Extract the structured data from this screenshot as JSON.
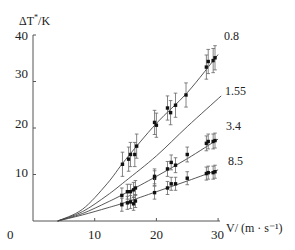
{
  "chart_data": {
    "type": "line",
    "title": "",
    "xlabel": "V/ (m · s⁻¹)",
    "ylabel": "ΔT*/K",
    "xlim": [
      0,
      30
    ],
    "ylim": [
      0,
      40
    ],
    "x_ticks": [
      0,
      10,
      20,
      30
    ],
    "y_ticks": [
      10,
      20,
      30,
      40
    ],
    "grid": false,
    "legend": "inline labels at line ends",
    "series": [
      {
        "name": "0.8",
        "curve": [
          [
            4,
            0
          ],
          [
            8,
            2.5
          ],
          [
            12,
            8
          ],
          [
            15,
            13.2
          ],
          [
            20,
            21
          ],
          [
            25,
            27.6
          ],
          [
            30,
            35.8
          ]
        ],
        "points": [
          [
            14.5,
            12.2
          ],
          [
            15.5,
            13.3
          ],
          [
            15.8,
            14.3
          ],
          [
            16.5,
            14.3
          ],
          [
            16.8,
            16.1
          ],
          [
            19.7,
            21.2
          ],
          [
            20,
            20.6
          ],
          [
            21.8,
            24.3
          ],
          [
            22.3,
            23.3
          ],
          [
            23.1,
            24.9
          ],
          [
            24.8,
            27.1
          ],
          [
            28.1,
            33.1
          ],
          [
            28.4,
            34.3
          ],
          [
            29.2,
            34.5
          ],
          [
            29.5,
            35.1
          ]
        ],
        "error": 2.6
      },
      {
        "name": "1.55",
        "curve": [
          [
            4,
            0
          ],
          [
            8,
            2
          ],
          [
            12,
            5.5
          ],
          [
            15,
            8.6
          ],
          [
            20,
            14
          ],
          [
            25,
            20.3
          ],
          [
            30.5,
            26.9
          ]
        ],
        "points": [],
        "error": 0
      },
      {
        "name": "3.4",
        "curve": [
          [
            4,
            0
          ],
          [
            8,
            1.6
          ],
          [
            12,
            4
          ],
          [
            15,
            6
          ],
          [
            20,
            9.6
          ],
          [
            25,
            13.4
          ],
          [
            30,
            17.6
          ]
        ],
        "points": [
          [
            14.4,
            5.5
          ],
          [
            15.3,
            6.3
          ],
          [
            15.8,
            6.3
          ],
          [
            16.3,
            6.7
          ],
          [
            16.6,
            7.1
          ],
          [
            19.7,
            9.2
          ],
          [
            19.7,
            9.6
          ],
          [
            21.8,
            11.2
          ],
          [
            22.4,
            12.6
          ],
          [
            23.1,
            12.0
          ],
          [
            25,
            14.3
          ],
          [
            28.1,
            16.7
          ],
          [
            28.4,
            17.1
          ],
          [
            29.2,
            17.1
          ],
          [
            29.5,
            17.3
          ]
        ],
        "error": 1.6
      },
      {
        "name": "8.5",
        "curve": [
          [
            4,
            0
          ],
          [
            8,
            1.3
          ],
          [
            12,
            2.8
          ],
          [
            15,
            4
          ],
          [
            20,
            6.3
          ],
          [
            25,
            8.6
          ],
          [
            30,
            11
          ]
        ],
        "points": [
          [
            14.4,
            3.5
          ],
          [
            15.3,
            3.9
          ],
          [
            15.8,
            4.1
          ],
          [
            16.3,
            3.7
          ],
          [
            16.6,
            4.3
          ],
          [
            19.7,
            6.1
          ],
          [
            21.8,
            7.1
          ],
          [
            22.4,
            8.0
          ],
          [
            23.1,
            8.0
          ],
          [
            25,
            9.2
          ],
          [
            28.1,
            10.2
          ],
          [
            28.4,
            10.4
          ],
          [
            29.2,
            10.4
          ],
          [
            29.5,
            10.6
          ]
        ],
        "error": 1.4
      }
    ]
  },
  "axes": {
    "y_title_main": "ΔT",
    "y_title_sup": "*",
    "y_title_unit": "/K",
    "x_title": "V/  (m · s⁻¹)",
    "x_tick_labels": [
      "0",
      "10",
      "20",
      "30"
    ],
    "y_tick_labels": [
      "10",
      "20",
      "30",
      "40"
    ]
  },
  "series_labels": [
    "0.8",
    "1.55",
    "3.4",
    "8.5"
  ]
}
